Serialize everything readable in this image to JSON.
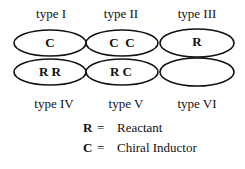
{
  "top_labels": [
    "type I",
    "type II",
    "type III"
  ],
  "bottom_labels": [
    "type IV",
    "type V",
    "type VI"
  ],
  "cells": {
    "row1": [
      "C",
      "C  C",
      "R"
    ],
    "row2": [
      "R R",
      "R C",
      ""
    ]
  },
  "legend": [
    {
      "symbol": "R",
      "eq": "=",
      "meaning": "Reactant"
    },
    {
      "symbol": "C",
      "eq": "=",
      "meaning": "Chiral Inductor"
    }
  ]
}
